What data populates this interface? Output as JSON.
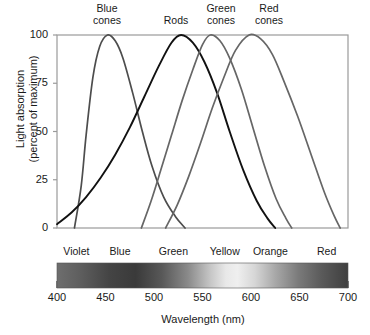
{
  "chart_data": {
    "type": "line",
    "title": "",
    "xlabel": "Wavelength (nm)",
    "ylabel": "Light absorption\n(percent of maximum)",
    "xlim": [
      400,
      700
    ],
    "ylim": [
      0,
      100
    ],
    "xticks": [
      "400",
      "450",
      "500",
      "550",
      "600",
      "650",
      "700"
    ],
    "yticks": [
      "0",
      "25",
      "50",
      "75",
      "100"
    ],
    "grid": false,
    "legend_position": "above-plot-inline",
    "series": [
      {
        "name": "Blue cones",
        "label": "Blue\ncones",
        "color": "#4d4d4d",
        "peak_x": 452,
        "peak_y": 100,
        "start_x": 418,
        "end_x": 532,
        "points": [
          {
            "x": 418,
            "y": 0
          },
          {
            "x": 425,
            "y": 22
          },
          {
            "x": 430,
            "y": 48
          },
          {
            "x": 437,
            "y": 78
          },
          {
            "x": 444,
            "y": 94
          },
          {
            "x": 452,
            "y": 100
          },
          {
            "x": 460,
            "y": 97
          },
          {
            "x": 468,
            "y": 88
          },
          {
            "x": 478,
            "y": 70
          },
          {
            "x": 488,
            "y": 50
          },
          {
            "x": 498,
            "y": 32
          },
          {
            "x": 510,
            "y": 16
          },
          {
            "x": 522,
            "y": 6
          },
          {
            "x": 532,
            "y": 0
          }
        ]
      },
      {
        "name": "Rods",
        "label": "Rods",
        "color": "#111111",
        "peak_x": 528,
        "peak_y": 100,
        "start_x": 400,
        "end_x": 625,
        "points": [
          {
            "x": 400,
            "y": 2
          },
          {
            "x": 415,
            "y": 8
          },
          {
            "x": 430,
            "y": 16
          },
          {
            "x": 445,
            "y": 26
          },
          {
            "x": 460,
            "y": 38
          },
          {
            "x": 475,
            "y": 52
          },
          {
            "x": 490,
            "y": 68
          },
          {
            "x": 505,
            "y": 84
          },
          {
            "x": 518,
            "y": 96
          },
          {
            "x": 528,
            "y": 100
          },
          {
            "x": 540,
            "y": 96
          },
          {
            "x": 552,
            "y": 86
          },
          {
            "x": 565,
            "y": 70
          },
          {
            "x": 578,
            "y": 50
          },
          {
            "x": 592,
            "y": 30
          },
          {
            "x": 606,
            "y": 14
          },
          {
            "x": 617,
            "y": 5
          },
          {
            "x": 625,
            "y": 0
          }
        ]
      },
      {
        "name": "Green cones",
        "label": "Green\ncones",
        "color": "#666666",
        "peak_x": 558,
        "peak_y": 100,
        "start_x": 487,
        "end_x": 642,
        "points": [
          {
            "x": 487,
            "y": 0
          },
          {
            "x": 497,
            "y": 14
          },
          {
            "x": 507,
            "y": 30
          },
          {
            "x": 518,
            "y": 48
          },
          {
            "x": 529,
            "y": 66
          },
          {
            "x": 540,
            "y": 82
          },
          {
            "x": 550,
            "y": 95
          },
          {
            "x": 558,
            "y": 100
          },
          {
            "x": 568,
            "y": 97
          },
          {
            "x": 578,
            "y": 88
          },
          {
            "x": 590,
            "y": 72
          },
          {
            "x": 602,
            "y": 52
          },
          {
            "x": 614,
            "y": 32
          },
          {
            "x": 626,
            "y": 15
          },
          {
            "x": 636,
            "y": 5
          },
          {
            "x": 642,
            "y": 0
          }
        ]
      },
      {
        "name": "Red cones",
        "label": "Red\ncones",
        "color": "#666666",
        "peak_x": 598,
        "peak_y": 100,
        "start_x": 512,
        "end_x": 692,
        "points": [
          {
            "x": 512,
            "y": 0
          },
          {
            "x": 524,
            "y": 12
          },
          {
            "x": 536,
            "y": 27
          },
          {
            "x": 548,
            "y": 44
          },
          {
            "x": 560,
            "y": 62
          },
          {
            "x": 572,
            "y": 78
          },
          {
            "x": 584,
            "y": 92
          },
          {
            "x": 598,
            "y": 100
          },
          {
            "x": 610,
            "y": 98
          },
          {
            "x": 622,
            "y": 90
          },
          {
            "x": 634,
            "y": 76
          },
          {
            "x": 648,
            "y": 58
          },
          {
            "x": 662,
            "y": 38
          },
          {
            "x": 676,
            "y": 18
          },
          {
            "x": 686,
            "y": 6
          },
          {
            "x": 692,
            "y": 0
          }
        ]
      }
    ],
    "spectrum_bar": {
      "range": [
        400,
        700
      ],
      "bands": [
        {
          "label": "Violet",
          "center": 420
        },
        {
          "label": "Blue",
          "center": 465
        },
        {
          "label": "Green",
          "center": 520
        },
        {
          "label": "Yellow",
          "center": 573
        },
        {
          "label": "Orange",
          "center": 620
        },
        {
          "label": "Red",
          "center": 678
        }
      ]
    }
  }
}
